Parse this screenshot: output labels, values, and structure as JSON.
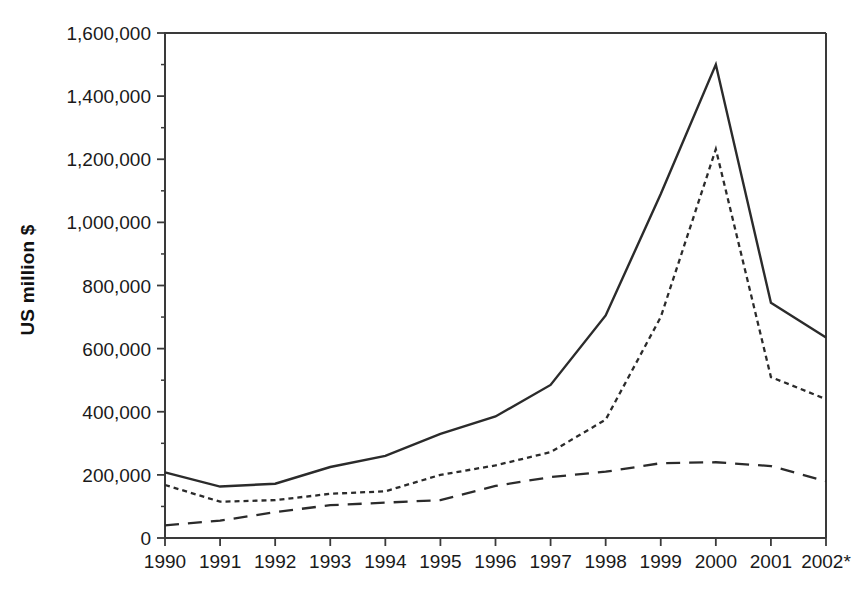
{
  "chart_data": {
    "type": "line",
    "title": "",
    "subtitle": "",
    "xlabel": "",
    "ylabel": "US million $",
    "categories": [
      "1990",
      "1991",
      "1992",
      "1993",
      "1994",
      "1995",
      "1996",
      "1997",
      "1998",
      "1999",
      "2000",
      "2001",
      "2002*"
    ],
    "x": [
      1990,
      1991,
      1992,
      1993,
      1994,
      1995,
      1996,
      1997,
      1998,
      1999,
      2000,
      2001,
      2002
    ],
    "ylim": [
      0,
      1600000
    ],
    "xlim": [
      1990,
      2002
    ],
    "y_ticks": [
      0,
      200000,
      400000,
      600000,
      800000,
      1000000,
      1200000,
      1400000,
      1600000
    ],
    "y_tick_labels": [
      "0",
      "200,000",
      "400,000",
      "600,000",
      "800,000",
      "1,000,000",
      "1,200,000",
      "1,400,000",
      "1,600,000"
    ],
    "y_minor_ticks": [
      100000,
      300000,
      500000,
      700000,
      900000,
      1100000,
      1300000,
      1500000
    ],
    "grid": false,
    "legend": false,
    "legend_position": "none",
    "series": [
      {
        "name": "series-solid",
        "line_style": "solid",
        "color": "#2b2b2b",
        "values": [
          208000,
          163000,
          172000,
          225000,
          260000,
          330000,
          385000,
          485000,
          705000,
          1090000,
          1500000,
          745000,
          635000
        ]
      },
      {
        "name": "series-dotted",
        "line_style": "dotted",
        "color": "#2b2b2b",
        "values": [
          168000,
          115000,
          120000,
          140000,
          148000,
          200000,
          230000,
          272000,
          375000,
          700000,
          1232000,
          510000,
          440000
        ]
      },
      {
        "name": "series-dashed",
        "line_style": "dashed",
        "color": "#2b2b2b",
        "values": [
          40000,
          55000,
          82000,
          104000,
          112000,
          120000,
          165000,
          193000,
          210000,
          237000,
          240000,
          228000,
          180000
        ]
      }
    ],
    "annotations": []
  },
  "axes": {
    "y_title": "US million $"
  }
}
